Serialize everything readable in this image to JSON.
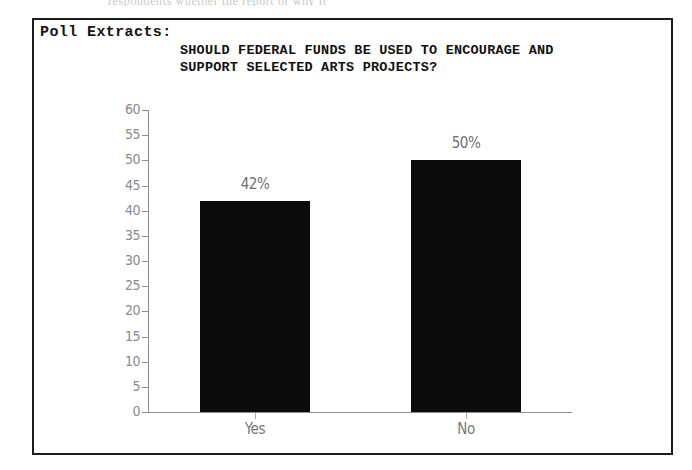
{
  "page": {
    "scan_remnant_text": "respondents whether the report or why it",
    "panel_label": "Poll Extracts:"
  },
  "chart_data": {
    "type": "bar",
    "title": "SHOULD FEDERAL FUNDS BE USED TO ENCOURAGE AND SUPPORT SELECTED ARTS PROJECTS?",
    "title_lines": [
      "SHOULD FEDERAL FUNDS BE USED TO ENCOURAGE AND",
      "SUPPORT SELECTED ARTS PROJECTS?"
    ],
    "categories": [
      "Yes",
      "No"
    ],
    "values": [
      42,
      50
    ],
    "value_labels": [
      "42%",
      "50%"
    ],
    "xlabel": "",
    "ylabel": "",
    "ylim": [
      0,
      60
    ],
    "ytick_step": 5,
    "yticks": [
      0,
      5,
      10,
      15,
      20,
      25,
      30,
      35,
      40,
      45,
      50,
      55,
      60
    ],
    "ytick_labels": [
      "0",
      "5",
      "10",
      "15",
      "20",
      "25",
      "30",
      "35",
      "40",
      "45",
      "50",
      "55",
      "60"
    ],
    "grid": false,
    "legend": false,
    "bar_color": "#0b0b0b",
    "axis_color": "#8d8d8d",
    "label_color": "#7a7a7a"
  }
}
